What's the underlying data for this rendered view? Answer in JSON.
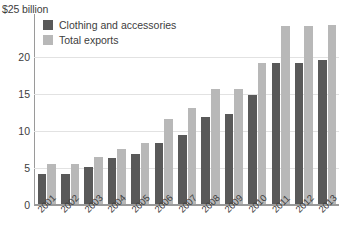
{
  "chart_data": {
    "type": "bar",
    "title": "",
    "subtitle": "",
    "xlabel": "",
    "ylabel": "$25 billion",
    "ylim": [
      0,
      25
    ],
    "yticks": [
      0,
      5,
      10,
      15,
      20
    ],
    "ytick_labels": [
      "0",
      "5",
      "10",
      "15",
      "20"
    ],
    "grid": true,
    "legend_position": "top-left",
    "categories": [
      "2001",
      "2002",
      "2003",
      "2004",
      "2005",
      "2006",
      "2007",
      "2008",
      "2009",
      "2010",
      "2011",
      "2012",
      "2013"
    ],
    "series": [
      {
        "name": "Clothing and accessories",
        "color": "#595959",
        "values": [
          4.0,
          4.0,
          5.0,
          6.2,
          6.8,
          8.2,
          9.3,
          11.8,
          12.2,
          14.7,
          19.0,
          19.1,
          19.4
        ]
      },
      {
        "name": "Total exports",
        "color": "#b8b8b8",
        "values": [
          5.4,
          5.4,
          6.3,
          7.5,
          8.3,
          11.5,
          13.0,
          15.5,
          15.5,
          19.0,
          24.0,
          24.1,
          24.2
        ]
      }
    ],
    "annotations": []
  },
  "axis": {
    "unit_caption": "$25 billion"
  },
  "legend": {
    "items": [
      {
        "label": "Clothing and accessories",
        "swatch": "dark"
      },
      {
        "label": "Total exports",
        "swatch": "light"
      }
    ]
  }
}
